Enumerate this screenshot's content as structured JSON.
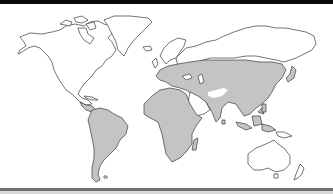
{
  "map": {
    "type": "world-distribution-map",
    "projection": "equirectangular",
    "colors": {
      "background": "#ffffff",
      "land": "#ffffff",
      "outline": "#3a3a3a",
      "range_fill": "#c4c4c4",
      "top_border": "#0a0a0a",
      "bottom_border": "#6e6e6e"
    },
    "shaded_range_regions": [
      "South America",
      "Central America (southern)",
      "Africa",
      "Europe (central and southern)",
      "Central Asia",
      "Siberia (southern)",
      "China",
      "Korea",
      "Indian subcontinent",
      "Southeast Asia",
      "Indonesia / Malay Archipelago"
    ],
    "unshaded_regions": [
      "North America",
      "Greenland",
      "Northern Europe / Scandinavia",
      "Northern Siberia",
      "Arabian Peninsula",
      "Iranian plateau / Tibet gap",
      "Australia",
      "New Zealand"
    ]
  }
}
